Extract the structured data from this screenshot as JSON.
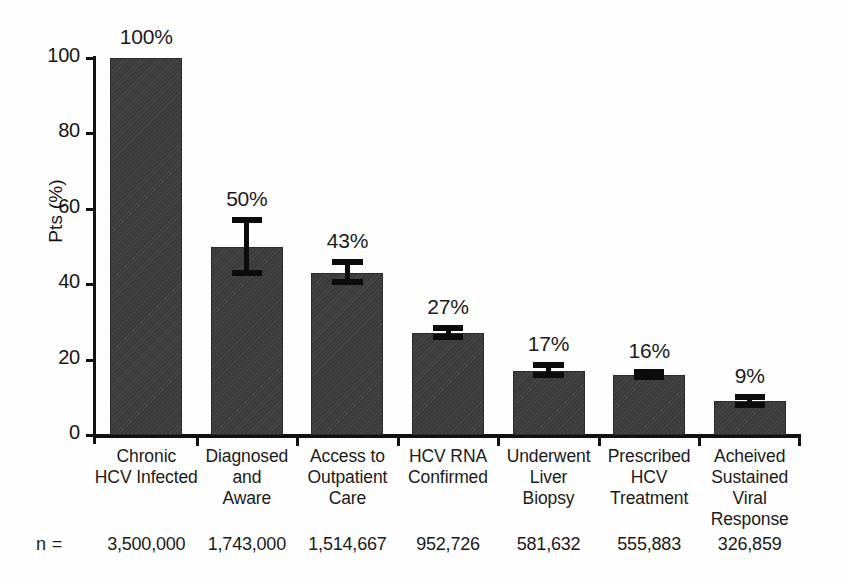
{
  "chart_data": {
    "type": "bar",
    "title": "",
    "xlabel": "",
    "ylabel": "Pts (%)",
    "ylim": [
      0,
      100
    ],
    "yticks": [
      0,
      20,
      40,
      60,
      80,
      100
    ],
    "ytick_labels": [
      "0",
      "20",
      "40",
      "60",
      "80",
      "100"
    ],
    "grid": false,
    "legend": "none",
    "bar_color": "#3d3d3d",
    "categories": [
      "Chronic\nHCV Infected",
      "Diagnosed\nand\nAware",
      "Access to\nOutpatient\nCare",
      "HCV RNA\nConfirmed",
      "Underwent\nLiver\nBiopsy",
      "Prescribed\nHCV\nTreatment",
      "Acheived\nSustained Viral\nResponse"
    ],
    "category_lines": [
      [
        "Chronic",
        "HCV Infected"
      ],
      [
        "Diagnosed",
        "and",
        "Aware"
      ],
      [
        "Access to",
        "Outpatient",
        "Care"
      ],
      [
        "HCV RNA",
        "Confirmed"
      ],
      [
        "Underwent",
        "Liver",
        "Biopsy"
      ],
      [
        "Prescribed",
        "HCV",
        "Treatment"
      ],
      [
        "Acheived",
        "Sustained Viral",
        "Response"
      ]
    ],
    "values": [
      100,
      50,
      43,
      27,
      17,
      16,
      9
    ],
    "value_labels": [
      "100%",
      "50%",
      "43%",
      "27%",
      "17%",
      "16%",
      "9%"
    ],
    "error_low": [
      null,
      43,
      40.5,
      26,
      16,
      15.5,
      8
    ],
    "error_high": [
      null,
      57,
      46,
      28.5,
      18.5,
      16.8,
      10
    ],
    "n_label": "n =",
    "n_values": [
      "3,500,000",
      "1,743,000",
      "1,514,667",
      "952,726",
      "581,632",
      "555,883",
      "326,859"
    ]
  }
}
